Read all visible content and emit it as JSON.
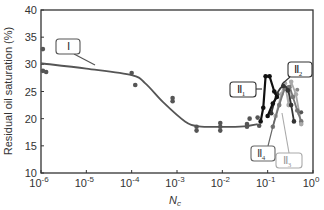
{
  "chart_data": {
    "type": "line",
    "title": "",
    "xlabel": "N_c",
    "xlabel_main": "N",
    "xlabel_sub": "c",
    "ylabel": "Residual oil saturation (%)",
    "xscale": "log",
    "xlim": [
      1e-06,
      1
    ],
    "ylim": [
      10,
      40
    ],
    "grid": false,
    "legend": "none (inline callout labels)",
    "x_ticks": [
      {
        "exp": "-6",
        "value": 1e-06
      },
      {
        "exp": "-5",
        "value": 1e-05
      },
      {
        "exp": "-4",
        "value": 0.0001
      },
      {
        "exp": "-3",
        "value": 0.001
      },
      {
        "exp": "-2",
        "value": 0.01
      },
      {
        "exp": "-1",
        "value": 0.1
      },
      {
        "exp": "0",
        "value": 1
      }
    ],
    "y_ticks": [
      10,
      15,
      20,
      25,
      30,
      35,
      40
    ],
    "series": [
      {
        "name": "I",
        "label_main": "Ⅱ",
        "color": "#555555",
        "style": "smooth-curve",
        "curve": [
          [
            1e-06,
            30.2
          ],
          [
            1e-05,
            29.2
          ],
          [
            0.0001,
            28.0
          ],
          [
            0.0002,
            26.5
          ],
          [
            0.0005,
            23.0
          ],
          [
            0.0015,
            19.5
          ],
          [
            0.003,
            18.6
          ],
          [
            0.01,
            18.5
          ],
          [
            0.03,
            18.6
          ],
          [
            0.06,
            19.0
          ]
        ],
        "points": [
          [
            1.1e-06,
            32.8
          ],
          [
            1.1e-06,
            28.8
          ],
          [
            1.3e-06,
            28.6
          ],
          [
            0.0001,
            28.4
          ],
          [
            0.00012,
            26.2
          ],
          [
            0.0008,
            23.8
          ],
          [
            0.0008,
            23.2
          ],
          [
            0.0027,
            18.5
          ],
          [
            0.0027,
            17.8
          ],
          [
            0.009,
            19.2
          ],
          [
            0.009,
            18.5
          ],
          [
            0.009,
            17.8
          ],
          [
            0.035,
            19.0
          ],
          [
            0.035,
            18.5
          ],
          [
            0.04,
            20.0
          ],
          [
            0.06,
            20.2
          ],
          [
            0.065,
            18.7
          ]
        ]
      },
      {
        "name": "II_1",
        "color": "#111111",
        "style": "polyline",
        "points": [
          [
            0.07,
            19.5
          ],
          [
            0.08,
            22.0
          ],
          [
            0.09,
            27.8
          ],
          [
            0.11,
            27.8
          ],
          [
            0.14,
            25.0
          ],
          [
            0.16,
            24.0
          ],
          [
            0.13,
            22.8
          ],
          [
            0.1,
            20.5
          ]
        ]
      },
      {
        "name": "II_2",
        "color": "#333333",
        "style": "smooth-curve",
        "points": [
          [
            0.12,
            21.0
          ],
          [
            0.16,
            24.5
          ],
          [
            0.22,
            26.0
          ],
          [
            0.28,
            25.2
          ],
          [
            0.33,
            22.5
          ],
          [
            0.38,
            19.5
          ]
        ]
      },
      {
        "name": "II_3",
        "color": "#aaaaaa",
        "style": "polyline",
        "points": [
          [
            0.15,
            20.5
          ],
          [
            0.2,
            24.5
          ],
          [
            0.24,
            26.5
          ],
          [
            0.29,
            22.5
          ],
          [
            0.33,
            26.8
          ],
          [
            0.42,
            24.5
          ],
          [
            0.5,
            21.0
          ],
          [
            0.55,
            19.0
          ]
        ]
      },
      {
        "name": "II_4",
        "color": "#777777",
        "style": "smooth-curve",
        "points": [
          [
            0.13,
            18.5
          ],
          [
            0.18,
            22.5
          ],
          [
            0.24,
            25.5
          ],
          [
            0.3,
            25.8
          ],
          [
            0.36,
            24.0
          ],
          [
            0.45,
            21.5
          ],
          [
            0.55,
            19.5
          ]
        ]
      }
    ],
    "isolated_points": [
      {
        "x": 0.45,
        "y": 25.3,
        "color": "#888888"
      },
      {
        "x": 0.55,
        "y": 21.2,
        "color": "#555555"
      },
      {
        "x": 0.55,
        "y": 19.0,
        "color": "#aaaaaa"
      }
    ],
    "annotations": [
      {
        "id": "I",
        "main": "Ⅰ",
        "sub": "",
        "box_color": "#555555",
        "text_color": "#333333"
      },
      {
        "id": "II_1",
        "main": "Ⅱ",
        "sub": "1",
        "box_color": "#333333",
        "text_color": "#222222"
      },
      {
        "id": "II_2",
        "main": "Ⅱ",
        "sub": "2",
        "box_color": "#333333",
        "text_color": "#222222"
      },
      {
        "id": "II_3",
        "main": "Ⅱ",
        "sub": "3",
        "box_color": "#aaaaaa",
        "text_color": "#999999"
      },
      {
        "id": "II_4",
        "main": "Ⅱ",
        "sub": "4",
        "box_color": "#666666",
        "text_color": "#444444"
      }
    ]
  }
}
